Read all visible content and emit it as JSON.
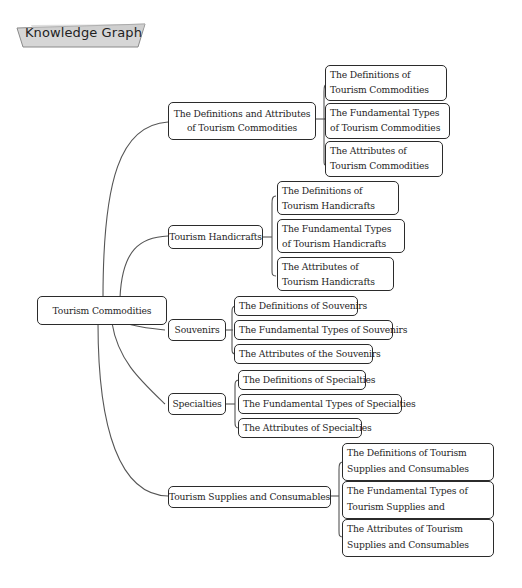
{
  "header": {
    "badge_label": "Knowledge Graph"
  },
  "colors": {
    "line": "#555555",
    "border": "#2b2b2b",
    "badge_fill": "#d6d6d6",
    "text": "#1f1f1f"
  },
  "root": {
    "label": "Tourism Commodities"
  },
  "branches": [
    {
      "label": "The Definitions and Attributes of Tourism Commodities",
      "children": [
        "The Definitions of Tourism Commodities",
        "The Fundamental Types of Tourism Commodities",
        "The Attributes of Tourism Commodities"
      ]
    },
    {
      "label": "Tourism Handicrafts",
      "children": [
        "The Definitions of Tourism Handicrafts",
        "The Fundamental Types of Tourism Handicrafts",
        "The Attributes of Tourism Handicrafts"
      ]
    },
    {
      "label": "Souvenirs",
      "children": [
        "The Definitions of Souvenirs",
        "The Fundamental Types of Souvenirs",
        "The Attributes of the Souvenirs"
      ]
    },
    {
      "label": "Specialties",
      "children": [
        "The Definitions of Specialties",
        "The Fundamental Types of Specialties",
        "The Attributes of Specialties"
      ]
    },
    {
      "label": "Tourism Supplies and Consumables",
      "children": [
        "The Definitions of Tourism Supplies and Consumables",
        "The Fundamental Types of Tourism Supplies and Consumables",
        "The Attributes of Tourism Supplies and Consumables"
      ]
    }
  ]
}
